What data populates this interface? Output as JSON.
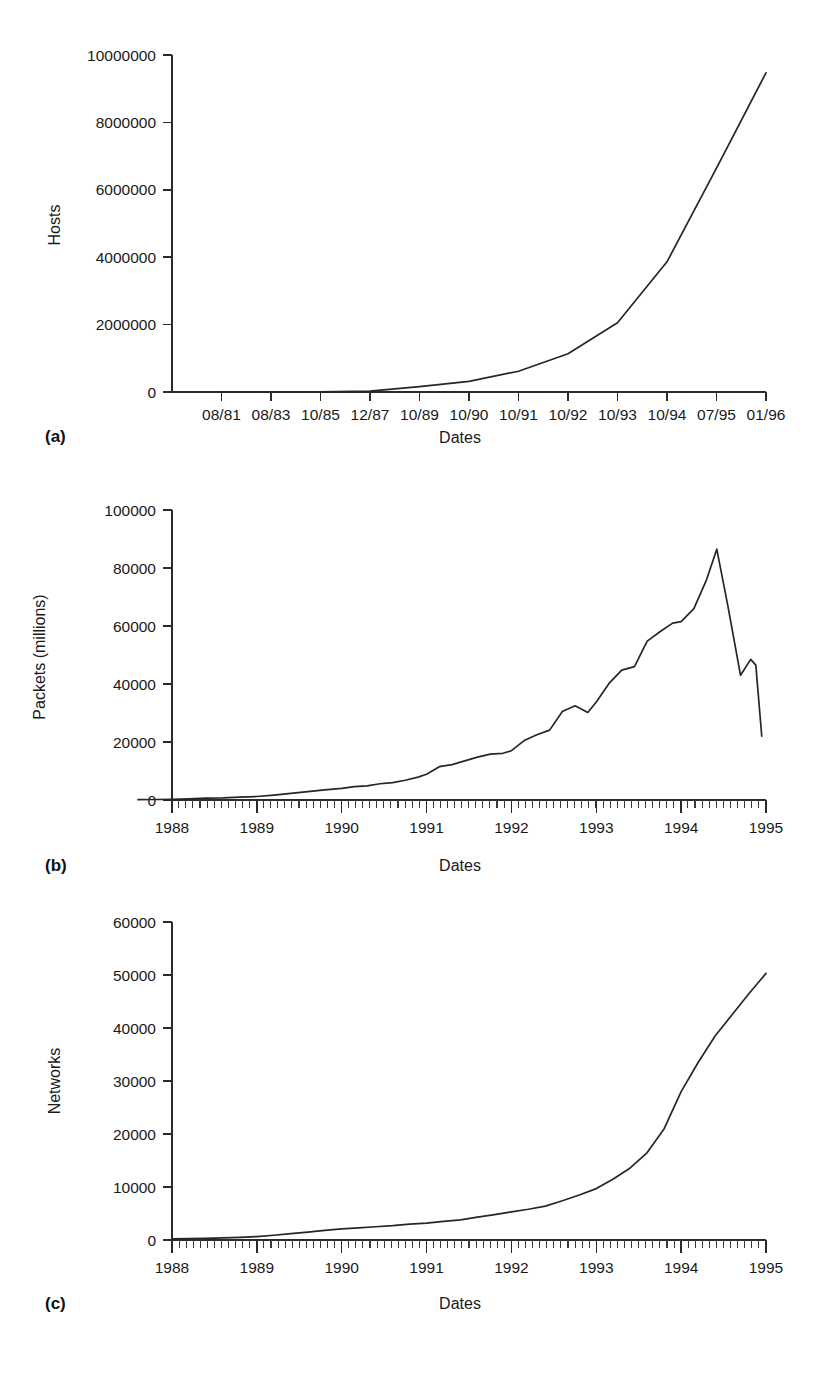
{
  "figure": {
    "panels": [
      {
        "tag": "(a)"
      },
      {
        "tag": "(b)"
      },
      {
        "tag": "(c)"
      }
    ],
    "caption_partial": ""
  },
  "chart_data": [
    {
      "type": "line",
      "panel": "(a)",
      "title": "",
      "xlabel": "Dates",
      "ylabel": "Hosts",
      "ylim": [
        0,
        10000000
      ],
      "yticks": [
        0,
        2000000,
        4000000,
        6000000,
        8000000,
        10000000
      ],
      "ytick_labels": [
        "0",
        "2000000",
        "4000000",
        "6000000",
        "8000000",
        "10000000"
      ],
      "xtick_labels": [
        "08/81",
        "08/83",
        "10/85",
        "12/87",
        "10/89",
        "10/90",
        "10/91",
        "10/92",
        "10/93",
        "10/94",
        "07/95",
        "01/96"
      ],
      "grid": false,
      "legend": "none",
      "x": [
        0,
        1,
        2,
        3,
        4,
        5,
        6,
        7,
        8,
        9,
        10,
        11
      ],
      "values": [
        213,
        562,
        2308,
        28174,
        159000,
        313000,
        617000,
        1136000,
        2056000,
        3864000,
        6642000,
        9472000
      ]
    },
    {
      "type": "line",
      "panel": "(b)",
      "title": "",
      "xlabel": "Dates",
      "ylabel": "Packets (millions)",
      "ylim": [
        0,
        100000
      ],
      "yticks": [
        0,
        20000,
        40000,
        60000,
        80000,
        100000
      ],
      "ytick_labels": [
        "0",
        "20000",
        "40000",
        "60000",
        "80000",
        "100000"
      ],
      "xtick_labels": [
        "1988",
        "1989",
        "1990",
        "1991",
        "1992",
        "1993",
        "1994",
        "1995"
      ],
      "grid": false,
      "legend": "none",
      "x": [
        1987.6,
        1987.8,
        1988.0,
        1988.2,
        1988.4,
        1988.6,
        1988.8,
        1989.0,
        1989.2,
        1989.4,
        1989.6,
        1989.8,
        1990.0,
        1990.15,
        1990.3,
        1990.45,
        1990.6,
        1990.75,
        1990.9,
        1991.0,
        1991.15,
        1991.3,
        1991.45,
        1991.6,
        1991.75,
        1991.9,
        1992.0,
        1992.15,
        1992.3,
        1992.45,
        1992.6,
        1992.75,
        1992.9,
        1993.0,
        1993.15,
        1993.3,
        1993.45,
        1993.6,
        1993.75,
        1993.9,
        1994.0,
        1994.15,
        1994.3,
        1994.42,
        1994.55,
        1994.7,
        1994.82,
        1994.88,
        1994.95
      ],
      "values": [
        120,
        170,
        240,
        420,
        650,
        700,
        980,
        1200,
        1700,
        2300,
        2900,
        3500,
        4000,
        4600,
        4900,
        5600,
        6000,
        6800,
        7900,
        8900,
        11500,
        12200,
        13500,
        14800,
        15800,
        16100,
        17000,
        20500,
        22500,
        24100,
        30500,
        32500,
        30200,
        33800,
        40200,
        44800,
        46000,
        54800,
        58000,
        61000,
        61500,
        66000,
        76000,
        86500,
        67000,
        43000,
        48500,
        46500,
        22000
      ]
    },
    {
      "type": "line",
      "panel": "(c)",
      "title": "",
      "xlabel": "Dates",
      "ylabel": "Networks",
      "ylim": [
        0,
        60000
      ],
      "yticks": [
        0,
        10000,
        20000,
        30000,
        40000,
        50000,
        60000
      ],
      "ytick_labels": [
        "0",
        "10000",
        "20000",
        "30000",
        "40000",
        "50000",
        "60000"
      ],
      "xtick_labels": [
        "1988",
        "1989",
        "1990",
        "1991",
        "1992",
        "1993",
        "1994",
        "1995"
      ],
      "grid": false,
      "legend": "none",
      "x": [
        1988.0,
        1988.2,
        1988.4,
        1988.6,
        1988.8,
        1989.0,
        1989.2,
        1989.4,
        1989.6,
        1989.8,
        1990.0,
        1990.2,
        1990.4,
        1990.6,
        1990.8,
        1991.0,
        1991.2,
        1991.4,
        1991.6,
        1991.8,
        1992.0,
        1992.2,
        1992.4,
        1992.6,
        1992.8,
        1993.0,
        1993.2,
        1993.4,
        1993.6,
        1993.8,
        1994.0,
        1994.2,
        1994.4,
        1994.6,
        1994.8,
        1995.0
      ],
      "values": [
        230,
        280,
        320,
        400,
        500,
        650,
        900,
        1200,
        1500,
        1800,
        2100,
        2300,
        2500,
        2700,
        3000,
        3200,
        3500,
        3800,
        4300,
        4800,
        5300,
        5800,
        6400,
        7400,
        8500,
        9700,
        11500,
        13600,
        16500,
        21000,
        28000,
        33500,
        38500,
        42500,
        46500,
        50300
      ]
    }
  ]
}
